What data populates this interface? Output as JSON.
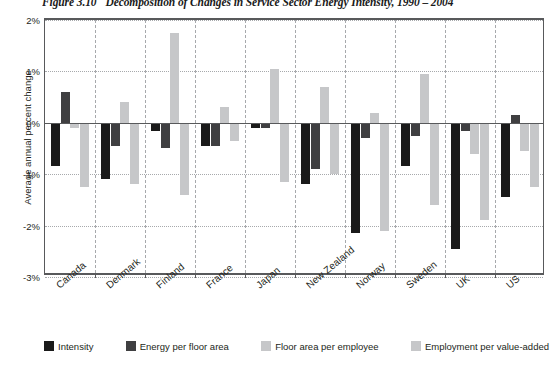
{
  "title": {
    "figure_number": "Figure 3.10",
    "text": "Decomposition of Changes in Service Sector Energy Intensity, 1990 – 2004"
  },
  "axes": {
    "y_title": "Average annual percent change",
    "y_ticks": [
      "2%",
      "1%",
      "0%",
      "-1%",
      "-2%",
      "-3%"
    ]
  },
  "legend": {
    "items": [
      {
        "label": "Intensity",
        "color": "#1a1a1a"
      },
      {
        "label": "Energy per floor area",
        "color": "#3f3f41"
      },
      {
        "label": "Floor area per employee",
        "color": "#c6c7c9"
      },
      {
        "label": "Employment per value-added",
        "color": "#c6c7c9"
      }
    ]
  },
  "chart_data": {
    "type": "bar",
    "title": "Decomposition of Changes in Service Sector Energy Intensity, 1990 – 2004",
    "xlabel": "",
    "ylabel": "Average annual percent change",
    "ylim": [
      -3,
      2
    ],
    "ytick_values": [
      2,
      1,
      0,
      -1,
      -2,
      -3
    ],
    "grid": "horizontal dotted, vertical dashed group separators",
    "legend_position": "bottom",
    "categories": [
      "Canada",
      "Denmark",
      "Finland",
      "France",
      "Japan",
      "New Zealand",
      "Norway",
      "Sweden",
      "UK",
      "US"
    ],
    "series": [
      {
        "name": "Intensity",
        "color": "#1a1a1a",
        "values": [
          -0.85,
          -1.1,
          -0.15,
          -0.45,
          -0.1,
          -1.2,
          -2.15,
          -0.85,
          -2.45,
          -1.45
        ]
      },
      {
        "name": "Energy per floor area",
        "color": "#3f3f41",
        "values": [
          0.6,
          -0.45,
          -0.5,
          -0.45,
          -0.1,
          -0.9,
          -0.3,
          -0.25,
          -0.15,
          0.15
        ]
      },
      {
        "name": "Floor area per employee",
        "color": "#c6c7c9",
        "values": [
          -0.1,
          0.4,
          1.75,
          0.3,
          1.05,
          0.7,
          0.2,
          0.95,
          -0.6,
          -0.55
        ]
      },
      {
        "name": "Employment per value-added",
        "color": "#c6c7c9",
        "values": [
          -1.25,
          -1.2,
          -1.4,
          -0.35,
          -1.15,
          -1.0,
          -2.1,
          -1.6,
          -1.9,
          -1.25
        ]
      }
    ]
  }
}
